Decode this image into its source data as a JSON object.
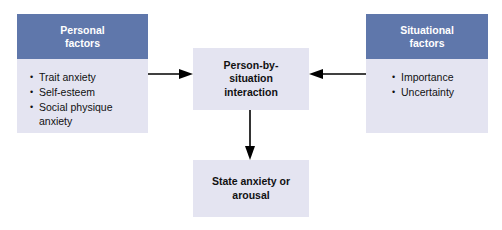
{
  "diagram": {
    "colors": {
      "header_blue": "#5f77ab",
      "body_lavender": "#e4e4f1",
      "header_text": "#ffffff",
      "body_text": "#111111",
      "arrow": "#000000",
      "background": "#ffffff"
    },
    "nodes": {
      "personal": {
        "header_line1": "Personal",
        "header_line2": "factors",
        "items": [
          "Trait anxiety",
          "Self-esteem",
          "Social physique anxiety"
        ]
      },
      "situational": {
        "header_line1": "Situational",
        "header_line2": "factors",
        "items": [
          "Importance",
          "Uncertainty"
        ]
      },
      "center": {
        "text": "Person-by-\nsituation\ninteraction"
      },
      "outcome": {
        "text": "State anxiety or\narousal"
      }
    },
    "arrows": [
      {
        "name": "personal-to-interaction",
        "direction": "right"
      },
      {
        "name": "situational-to-interaction",
        "direction": "left"
      },
      {
        "name": "interaction-to-outcome",
        "direction": "down"
      }
    ]
  }
}
